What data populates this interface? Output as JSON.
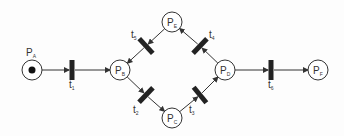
{
  "diagram": {
    "type": "petri-net",
    "colors": {
      "stroke": "#333333",
      "bar": "#222222",
      "background": "#fdfdfd"
    },
    "places": [
      {
        "id": "PA",
        "label": "P",
        "sub": "A",
        "x": 32,
        "y": 70,
        "tokens": 1
      },
      {
        "id": "PB",
        "label": "P",
        "sub": "B",
        "x": 120,
        "y": 70,
        "tokens": 0
      },
      {
        "id": "PC",
        "label": "P",
        "sub": "C",
        "x": 172,
        "y": 118,
        "tokens": 0
      },
      {
        "id": "PD",
        "label": "P",
        "sub": "D",
        "x": 225,
        "y": 70,
        "tokens": 0
      },
      {
        "id": "PE",
        "label": "P",
        "sub": "E",
        "x": 172,
        "y": 22,
        "tokens": 0
      },
      {
        "id": "PF",
        "label": "P",
        "sub": "F",
        "x": 318,
        "y": 70,
        "tokens": 0
      }
    ],
    "transitions": [
      {
        "id": "t1",
        "label": "t",
        "sub": "1",
        "x": 72,
        "y": 70
      },
      {
        "id": "t2",
        "label": "t",
        "sub": "2",
        "x": 146,
        "y": 95
      },
      {
        "id": "t3",
        "label": "t",
        "sub": "3",
        "x": 200,
        "y": 95
      },
      {
        "id": "t4",
        "label": "t",
        "sub": "4",
        "x": 200,
        "y": 46
      },
      {
        "id": "t5",
        "label": "t",
        "sub": "5",
        "x": 146,
        "y": 46
      },
      {
        "id": "t6",
        "label": "t",
        "sub": "6",
        "x": 271,
        "y": 70
      }
    ],
    "arcs": [
      [
        "PA",
        "t1"
      ],
      [
        "t1",
        "PB"
      ],
      [
        "PB",
        "t2"
      ],
      [
        "t2",
        "PC"
      ],
      [
        "PC",
        "t3"
      ],
      [
        "t3",
        "PD"
      ],
      [
        "PD",
        "t4"
      ],
      [
        "t4",
        "PE"
      ],
      [
        "PE",
        "t5"
      ],
      [
        "t5",
        "PB"
      ],
      [
        "PD",
        "t6"
      ],
      [
        "t6",
        "PF"
      ]
    ]
  }
}
